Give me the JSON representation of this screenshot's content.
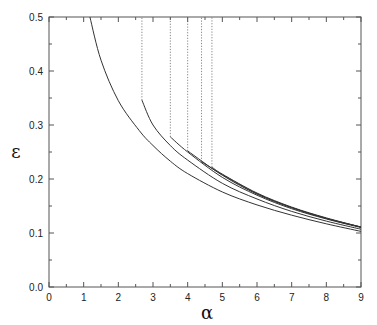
{
  "chart_data": {
    "type": "line",
    "title": "",
    "xlabel": "α",
    "ylabel": "ε",
    "xlim": [
      0,
      9
    ],
    "ylim": [
      0,
      0.5
    ],
    "xticks": [
      0,
      1,
      2,
      3,
      4,
      5,
      6,
      7,
      8,
      9
    ],
    "yticks": [
      0.0,
      0.1,
      0.2,
      0.3,
      0.4,
      0.5
    ],
    "ytick_labels": [
      "0.0",
      "0.1",
      "0.2",
      "0.3",
      "0.4",
      "0.5"
    ],
    "grid": false,
    "legend": null,
    "series": [
      {
        "name": "curve-1",
        "style": "solid",
        "x": [
          1.18,
          1.5,
          2.0,
          2.6,
          3.0,
          3.5,
          4.0,
          5.0,
          6.0,
          7.0,
          8.0,
          9.0
        ],
        "y": [
          0.5,
          0.42,
          0.345,
          0.29,
          0.262,
          0.233,
          0.21,
          0.176,
          0.152,
          0.133,
          0.117,
          0.103
        ]
      },
      {
        "name": "curve-2",
        "style": "solid",
        "x": [
          2.68,
          3.0,
          3.5,
          4.0,
          5.0,
          6.0,
          7.0,
          8.0,
          9.0
        ],
        "y": [
          0.346,
          0.3,
          0.262,
          0.235,
          0.192,
          0.163,
          0.14,
          0.122,
          0.107
        ]
      },
      {
        "name": "curve-3",
        "style": "solid",
        "x": [
          3.5,
          4.0,
          5.0,
          6.0,
          7.0,
          8.0,
          9.0
        ],
        "y": [
          0.278,
          0.25,
          0.203,
          0.17,
          0.145,
          0.126,
          0.11
        ]
      },
      {
        "name": "curve-4",
        "style": "solid",
        "x": [
          4.0,
          5.0,
          6.0,
          7.0,
          8.0,
          9.0
        ],
        "y": [
          0.252,
          0.207,
          0.172,
          0.147,
          0.127,
          0.111
        ]
      },
      {
        "name": "curve-5",
        "style": "solid",
        "x": [
          4.4,
          5.0,
          6.0,
          7.0,
          8.0,
          9.0
        ],
        "y": [
          0.232,
          0.208,
          0.173,
          0.147,
          0.127,
          0.111
        ]
      },
      {
        "name": "curve-6",
        "style": "solid",
        "x": [
          4.7,
          5.0,
          6.0,
          7.0,
          8.0,
          9.0
        ],
        "y": [
          0.222,
          0.209,
          0.174,
          0.148,
          0.128,
          0.111
        ]
      }
    ],
    "annotations": [
      {
        "type": "vline",
        "style": "dotted",
        "x": 2.68,
        "y_from": 0.346,
        "y_to": 0.5
      },
      {
        "type": "vline",
        "style": "dotted",
        "x": 3.5,
        "y_from": 0.278,
        "y_to": 0.5
      },
      {
        "type": "vline",
        "style": "dotted",
        "x": 4.0,
        "y_from": 0.252,
        "y_to": 0.5
      },
      {
        "type": "vline",
        "style": "dotted",
        "x": 4.4,
        "y_from": 0.232,
        "y_to": 0.5
      },
      {
        "type": "vline",
        "style": "dotted",
        "x": 4.7,
        "y_from": 0.222,
        "y_to": 0.5
      }
    ]
  },
  "style": {
    "line_color": "#333333",
    "axis_color": "#555555"
  }
}
